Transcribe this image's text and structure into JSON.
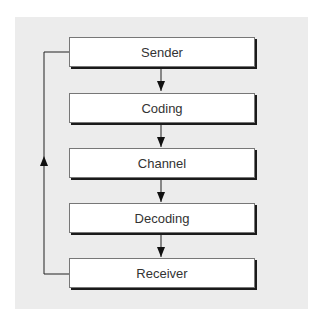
{
  "diagram": {
    "type": "flowchart",
    "nodes": [
      {
        "id": "sender",
        "label": "Sender"
      },
      {
        "id": "coding",
        "label": "Coding"
      },
      {
        "id": "channel",
        "label": "Channel"
      },
      {
        "id": "decoding",
        "label": "Decoding"
      },
      {
        "id": "receiver",
        "label": "Receiver"
      }
    ],
    "edges": [
      {
        "from": "sender",
        "to": "coding"
      },
      {
        "from": "coding",
        "to": "channel"
      },
      {
        "from": "channel",
        "to": "decoding"
      },
      {
        "from": "decoding",
        "to": "receiver"
      },
      {
        "from": "receiver",
        "to": "sender",
        "kind": "feedback"
      }
    ],
    "colors": {
      "panel": "#ececec",
      "box": "#ffffff",
      "line": "#222222"
    }
  }
}
